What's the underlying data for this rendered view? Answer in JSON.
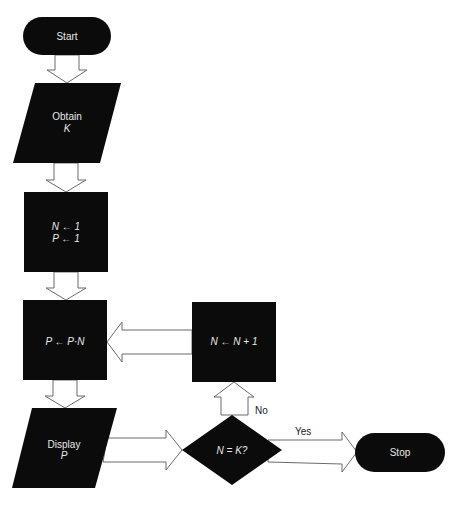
{
  "flowchart": {
    "start": {
      "label": "Start"
    },
    "input": {
      "line1": "Obtain",
      "line2": "K"
    },
    "init": {
      "line1": "N ← 1",
      "line2": "P ← 1"
    },
    "multiply": {
      "label": "P ← P·N"
    },
    "increment": {
      "label": "N ← N + 1"
    },
    "output": {
      "line1": "Display",
      "line2": "P"
    },
    "decision": {
      "label": "N = K?"
    },
    "stop": {
      "label": "Stop"
    },
    "edges": {
      "no_label": "No",
      "yes_label": "Yes"
    },
    "colors": {
      "shape_fill": "#0b0b0b",
      "text": "#e8e8e8",
      "arrow_stroke": "#6a6a6a",
      "background": "#ffffff"
    }
  }
}
